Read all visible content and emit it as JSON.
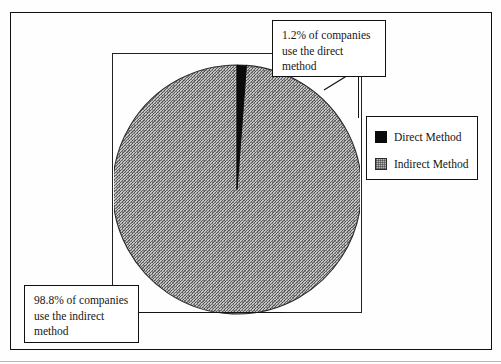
{
  "chart_data": {
    "type": "pie",
    "title": "",
    "categories": [
      "Direct Method",
      "Indirect Method"
    ],
    "values": [
      1.2,
      98.8
    ],
    "value_unit": "%",
    "series": [
      {
        "name": "Percent of companies",
        "values": [
          1.2,
          98.8
        ]
      }
    ],
    "start_angle_deg": 0,
    "direction": "clockwise",
    "legend_position": "right",
    "grid": false,
    "annotations": [
      "1.2% of companies use the direct method",
      "98.8% of companies use the indirect method"
    ],
    "colors": {
      "Direct Method": "#0a0a0a",
      "Indirect Method": "#9a9a9a"
    }
  },
  "callouts": {
    "direct": {
      "line1": "1.2% of companies",
      "line2": "use the direct",
      "line3": "method"
    },
    "indirect": {
      "line1": "98.8% of companies",
      "line2": "use the indirect",
      "line3": "method"
    }
  },
  "legend": {
    "items": [
      {
        "label": "Direct Method",
        "swatch": "black-square-swatch",
        "color": "#0a0a0a"
      },
      {
        "label": "Indirect Method",
        "swatch": "stippled-gray-square-swatch",
        "color": "#9a9a9a"
      }
    ]
  }
}
